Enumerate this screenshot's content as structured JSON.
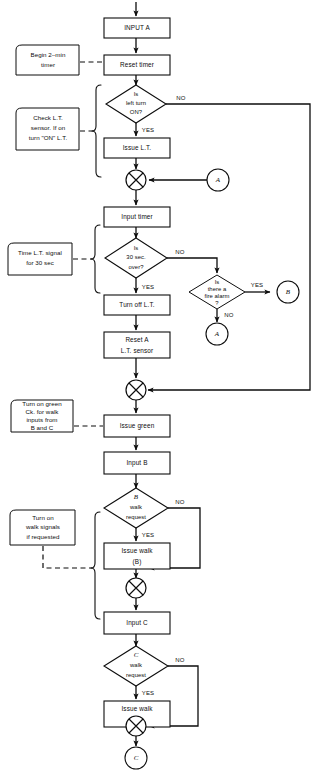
{
  "diagram": {
    "background_color": "#ffffff",
    "line_color": "#0d0d0d"
  },
  "process_boxes": {
    "input_a": "INPUT A",
    "reset_timer": "Reset timer",
    "issue_lt": "Issue L.T.",
    "input_timer": "Input timer",
    "turn_off_lt": "Turn off L.T.",
    "reset_a_line1": "Reset A",
    "reset_a_line2": "L.T. sensor",
    "issue_green": "Issue green",
    "input_b": "Input B",
    "issue_walk_b_line1": "Issue walk",
    "issue_walk_b_line2": "(B)",
    "input_c": "Input C",
    "issue_walk_c_line1": "Issue walk",
    "issue_walk_c_line2": "(C)"
  },
  "decisions": {
    "left_turn": {
      "line1": "Is",
      "line2": "left turn",
      "line3": "ON?",
      "yes": "YES",
      "no": "NO"
    },
    "thirty_sec": {
      "line1": "Is",
      "line2": "30 sec.",
      "line3": "over?",
      "yes": "YES",
      "no": "NO"
    },
    "fire_alarm": {
      "line1": "Is",
      "line2": "there a",
      "line3": "fire alarm",
      "line4": "?",
      "yes": "YES",
      "no": "NO"
    },
    "b_walk": {
      "line1": "B",
      "line2": "walk",
      "line3": "request",
      "yes": "YES",
      "no": "NO"
    },
    "c_walk": {
      "line1": "C",
      "line2": "walk",
      "line3": "request",
      "yes": "YES",
      "no": "NO"
    }
  },
  "annotations": {
    "begin_timer": {
      "line1": "Begin 2–min",
      "line2": "timer"
    },
    "check_lt_sensor": {
      "line1": "Check L.T.",
      "line2": "sensor. If on",
      "line3": "turn \"ON\" L.T."
    },
    "time_lt_signal": {
      "line1": "Time L.T. signal",
      "line2": "for 30 sec"
    },
    "turn_on_green": {
      "line1": "Turn on green",
      "line2": "Ck. for walk",
      "line3": "inputs from",
      "line4": "B and C"
    },
    "turn_on_walk": {
      "line1": "Turn on",
      "line2": "walk signals",
      "line3": "if requested"
    }
  },
  "connectors": {
    "a_right": "A",
    "b_right": "B",
    "a_below_fire": "A",
    "c_terminal": "C"
  }
}
